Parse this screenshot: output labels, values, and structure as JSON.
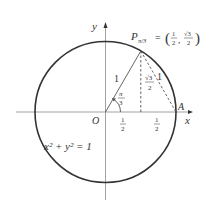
{
  "figure": {
    "circle_equation": "x² + y² = 1",
    "axis_x_label": "x",
    "axis_y_label": "y",
    "origin_label": "O",
    "point_A_label": "A",
    "point_P": {
      "name": "P",
      "subscript": "π/3",
      "equals": "=",
      "coord_x_num": "1",
      "coord_x_den": "2",
      "coord_y_num": "√3",
      "coord_y_den": "2"
    },
    "radius_label": "1",
    "chord_label": "1",
    "angle_label_num": "π",
    "angle_label_den": "3",
    "height_label_num": "√3",
    "height_label_den": "2",
    "half_1_num": "1",
    "half_1_den": "2",
    "half_2_num": "1",
    "half_2_den": "2"
  }
}
